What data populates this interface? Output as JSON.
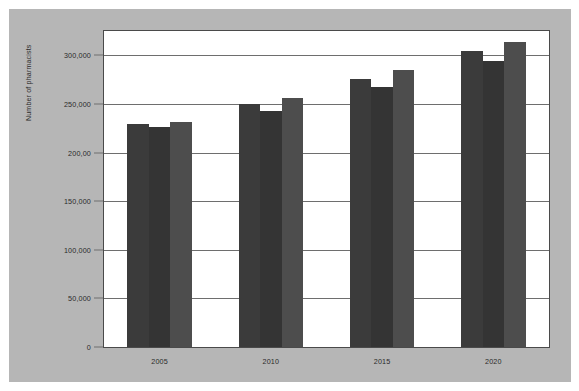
{
  "figure": {
    "background_color": "#b6b6b6",
    "plot_background_color": "#ffffff",
    "border_color": "#4a4a4a"
  },
  "axis": {
    "y_title": "Number of pharmacists",
    "y_tick_labels": [
      "0",
      "50,000",
      "100,000",
      "150,000",
      "200,00",
      "250,000",
      "300,000"
    ],
    "x_tick_labels": [
      "2005",
      "2010",
      "2015",
      "2020"
    ]
  },
  "chart_data": {
    "type": "bar",
    "title": "",
    "subtitle": "",
    "xlabel": "",
    "ylabel": "Number of pharmacists",
    "categories": [
      "2005",
      "2010",
      "2015",
      "2020"
    ],
    "series": [
      {
        "name": "Series 1",
        "color": "#3b3b3b",
        "values": [
          229000,
          250000,
          276000,
          304000
        ]
      },
      {
        "name": "Series 2",
        "color": "#343434",
        "values": [
          226000,
          243000,
          267000,
          294000
        ]
      },
      {
        "name": "Series 3",
        "color": "#4d4d4d",
        "values": [
          231000,
          256000,
          285000,
          314000
        ]
      }
    ],
    "ylim": [
      0,
      325000
    ],
    "yticks": [
      0,
      50000,
      100000,
      150000,
      200000,
      250000,
      300000
    ],
    "ytick_labels": [
      "0",
      "50,000",
      "100,000",
      "150,000",
      "200,00",
      "250,000",
      "300,000"
    ],
    "grid": true,
    "grid_axis": "y",
    "legend": false,
    "legend_position": "none",
    "bar_group_gap": true,
    "annotations": []
  }
}
